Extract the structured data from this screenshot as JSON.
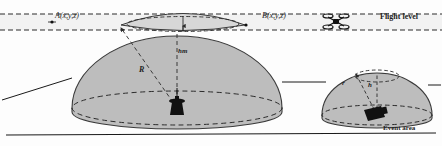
{
  "figure": {
    "background_color": "#fdfdfd",
    "width": 442,
    "height": 146
  },
  "labels": {
    "point_a": "A(x,y,z)",
    "point_b": "B(x,y,z)",
    "flight_level": "Flight level",
    "big_radius": "R",
    "big_height": "hm",
    "small_radius": "r",
    "small_height": "h",
    "event_area": "Event area"
  },
  "icons": {
    "camera_large": "camera-tripod-icon",
    "camera_small": "camera-box-icon",
    "drone": "quadcopter-drone-icon"
  },
  "colors": {
    "dome_fill": "#bdbdbd",
    "dome_stroke": "#3a3a3a",
    "dashed_stroke": "#2b2b2b",
    "ground_line": "#1a1a1a",
    "band_fill": "#f2f2f2",
    "text": "#1d1d1d"
  },
  "geometry": {
    "flight_band": {
      "top_y": 14,
      "bottom_y": 30
    },
    "ground_y": 136,
    "large_dome": {
      "cx": 177,
      "cy": 108,
      "rx": 105,
      "ry": 72,
      "base_ry": 17
    },
    "small_dome": {
      "cx": 377,
      "cy": 115,
      "rx": 55,
      "ry": 42,
      "base_ry": 10
    },
    "lens": {
      "cx": 183,
      "cy": 22,
      "rx": 62,
      "ry": 11
    }
  }
}
